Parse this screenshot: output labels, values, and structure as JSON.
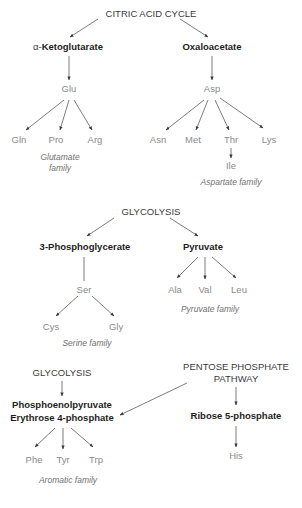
{
  "sources": {
    "citric_acid_cycle": "CITRIC ACID CYCLE",
    "glycolysis_1": "GLYCOLYSIS",
    "glycolysis_2": "GLYCOLYSIS",
    "pentose_line1": "PENTOSE PHOSPHATE",
    "pentose_line2": "PATHWAY"
  },
  "precursors": {
    "alpha_ketoglutarate_prefix": "α-",
    "alpha_ketoglutarate": "Ketoglutarate",
    "oxaloacetate": "Oxaloacetate",
    "phosphoglycerate": "3-Phosphoglycerate",
    "pyruvate": "Pyruvate",
    "pep": "Phosphoenolpyruvate",
    "erythrose": "Erythrose 4-phosphate",
    "ribose": "Ribose 5-phosphate"
  },
  "amino_acids": {
    "glu": "Glu",
    "gln": "Gln",
    "pro": "Pro",
    "arg": "Arg",
    "asp": "Asp",
    "asn": "Asn",
    "met": "Met",
    "thr": "Thr",
    "lys": "Lys",
    "ile": "Ile",
    "ser": "Ser",
    "cys": "Cys",
    "gly": "Gly",
    "ala": "Ala",
    "val": "Val",
    "leu": "Leu",
    "phe": "Phe",
    "tyr": "Tyr",
    "trp": "Trp",
    "his": "His"
  },
  "families": {
    "glutamate_line1": "Glutamate",
    "glutamate_line2": "family",
    "aspartate": "Aspartate family",
    "serine": "Serine family",
    "pyruvate": "Pyruvate family",
    "aromatic": "Aromatic family"
  }
}
